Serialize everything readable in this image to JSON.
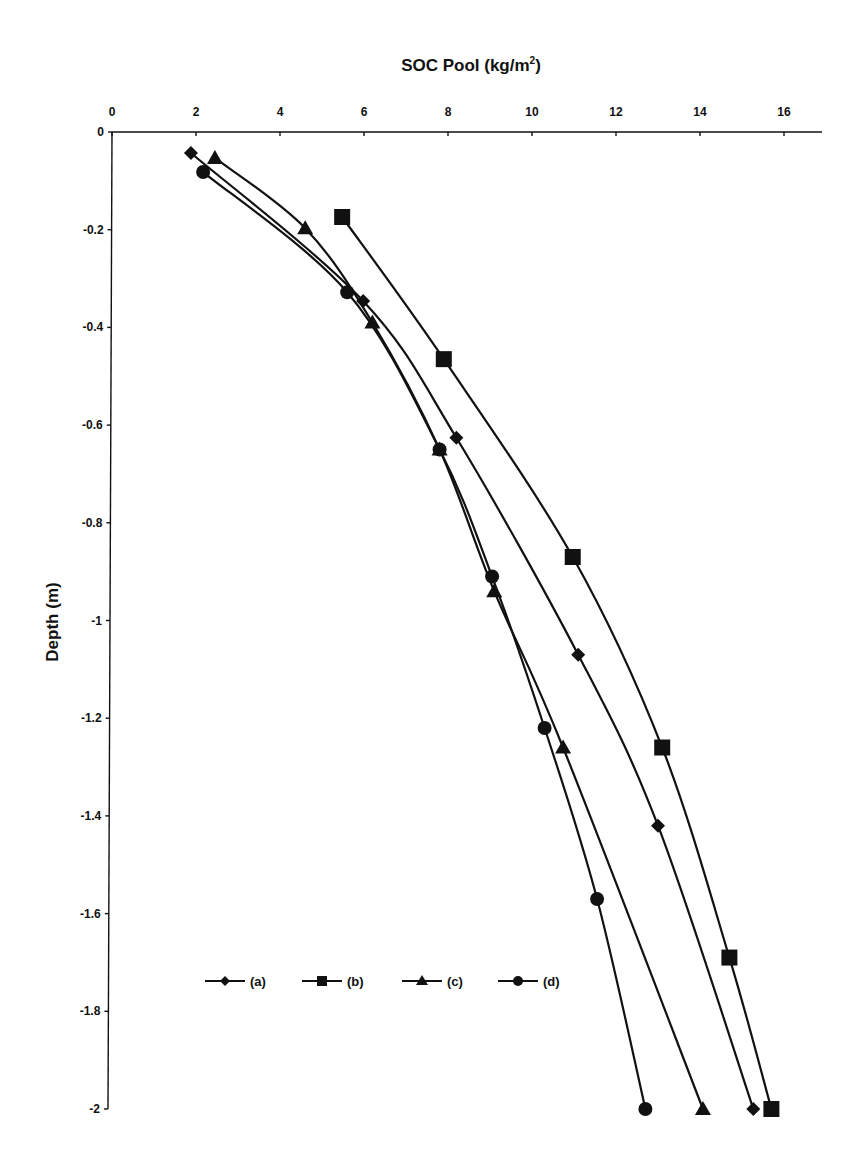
{
  "chart_data": {
    "type": "line",
    "xlabel": "SOC Pool (kg/m²)",
    "ylabel": "Depth (m)",
    "xlim": [
      0,
      17
    ],
    "ylim": [
      -2,
      0
    ],
    "x_ticks": [
      0,
      2,
      4,
      6,
      8,
      10,
      12,
      14,
      16
    ],
    "y_ticks": [
      0,
      -0.2,
      -0.4,
      -0.6,
      -0.8,
      -1,
      -1.2,
      -1.4,
      -1.6,
      -1.8,
      -2
    ],
    "x_tick_labels": [
      "0",
      "2",
      "4",
      "6",
      "8",
      "10",
      "12",
      "14",
      "16"
    ],
    "y_tick_labels": [
      "0",
      "-0.2",
      "-0.4",
      "-0.6",
      "-0.8",
      "-1",
      "-1.2",
      "-1.4",
      "-1.6",
      "-1.8",
      "-2"
    ],
    "x_axis_position": "top",
    "grid": false,
    "legend_position": "lower-left inside",
    "series": [
      {
        "name": "(a)",
        "marker": "diamond",
        "x": [
          1.88,
          5.98,
          8.2,
          11.1,
          13.0,
          15.27
        ],
        "y": [
          -0.043,
          -0.346,
          -0.626,
          -1.07,
          -1.42,
          -2.0
        ]
      },
      {
        "name": "(b)",
        "marker": "square",
        "x": [
          5.48,
          7.9,
          10.97,
          13.1,
          14.7,
          15.7
        ],
        "y": [
          -0.174,
          -0.465,
          -0.87,
          -1.26,
          -1.69,
          -2.0
        ]
      },
      {
        "name": "(c)",
        "marker": "triangle",
        "x": [
          2.45,
          4.6,
          6.2,
          7.8,
          9.1,
          10.74,
          14.07
        ],
        "y": [
          -0.053,
          -0.197,
          -0.39,
          -0.65,
          -0.94,
          -1.26,
          -2.0
        ]
      },
      {
        "name": "(d)",
        "marker": "circle",
        "x": [
          2.17,
          5.6,
          7.8,
          9.05,
          10.3,
          11.55,
          12.7
        ],
        "y": [
          -0.082,
          -0.328,
          -0.65,
          -0.91,
          -1.22,
          -1.57,
          -2.0
        ]
      }
    ]
  },
  "legend": {
    "items": [
      {
        "label": "(a)",
        "marker": "diamond"
      },
      {
        "label": "(b)",
        "marker": "square"
      },
      {
        "label": "(c)",
        "marker": "triangle"
      },
      {
        "label": "(d)",
        "marker": "circle"
      }
    ]
  },
  "colors": {
    "ink": "#111111",
    "background": "#ffffff"
  }
}
